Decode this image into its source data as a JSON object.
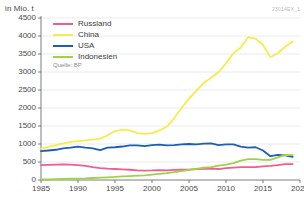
{
  "header": {
    "unit_label": "in Mio. t",
    "chart_id": "23014EX_1"
  },
  "source": "Quelle: BP",
  "legend": [
    {
      "label": "Russland",
      "color": "#ef5f8c"
    },
    {
      "label": "China",
      "color": "#f5ec4e"
    },
    {
      "label": "USA",
      "color": "#1c5fb4"
    },
    {
      "label": "Indonesien",
      "color": "#9fd14a"
    }
  ],
  "axes": {
    "y_ticks": [
      "4500",
      "4000",
      "3500",
      "3000",
      "2500",
      "2000",
      "1500",
      "1000",
      "500",
      "0"
    ],
    "x_ticks": [
      "1985",
      "1990",
      "1995",
      "2000",
      "2005",
      "2010",
      "2015",
      "2020"
    ]
  },
  "chart_data": {
    "type": "line",
    "title": "",
    "subtitle": "",
    "xlabel": "",
    "ylabel": "in Mio. t",
    "xlim": [
      1985,
      2020
    ],
    "ylim": [
      0,
      4500
    ],
    "grid": true,
    "legend_position": "top-left",
    "x": [
      1985,
      1986,
      1987,
      1988,
      1989,
      1990,
      1991,
      1992,
      1993,
      1994,
      1995,
      1996,
      1997,
      1998,
      1999,
      2000,
      2001,
      2002,
      2003,
      2004,
      2005,
      2006,
      2007,
      2008,
      2009,
      2010,
      2011,
      2012,
      2013,
      2014,
      2015,
      2016,
      2017,
      2018,
      2019
    ],
    "series": [
      {
        "name": "Russland",
        "color": "#ef5f8c",
        "values": [
          415,
          420,
          425,
          430,
          428,
          415,
          390,
          355,
          330,
          315,
          305,
          295,
          285,
          265,
          260,
          265,
          275,
          270,
          280,
          285,
          290,
          300,
          310,
          315,
          305,
          330,
          345,
          360,
          355,
          360,
          380,
          390,
          415,
          440,
          440
        ]
      },
      {
        "name": "China",
        "color": "#f5ec4e",
        "values": [
          870,
          920,
          970,
          1020,
          1060,
          1080,
          1100,
          1120,
          1150,
          1240,
          1360,
          1400,
          1380,
          1300,
          1280,
          1300,
          1380,
          1480,
          1720,
          2000,
          2260,
          2480,
          2700,
          2840,
          3000,
          3240,
          3520,
          3680,
          3970,
          3930,
          3750,
          3410,
          3520,
          3700,
          3850
        ]
      },
      {
        "name": "USA",
        "color": "#1c5fb4",
        "values": [
          800,
          820,
          840,
          880,
          900,
          930,
          900,
          880,
          830,
          900,
          910,
          930,
          960,
          960,
          940,
          970,
          980,
          960,
          970,
          990,
          1000,
          990,
          1010,
          1020,
          970,
          990,
          990,
          930,
          900,
          910,
          820,
          660,
          700,
          685,
          640
        ]
      },
      {
        "name": "Indonesien",
        "color": "#9fd14a",
        "values": [
          15,
          20,
          25,
          30,
          35,
          40,
          45,
          55,
          65,
          75,
          85,
          100,
          110,
          120,
          130,
          150,
          170,
          190,
          220,
          250,
          280,
          310,
          340,
          360,
          400,
          430,
          470,
          540,
          580,
          580,
          560,
          560,
          630,
          700,
          690
        ]
      }
    ]
  }
}
